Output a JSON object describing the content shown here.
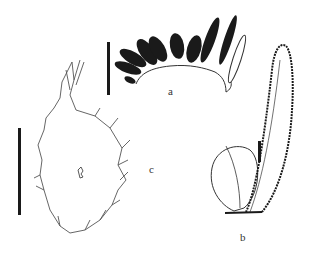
{
  "figure": {
    "panels": [
      {
        "id": "a",
        "label": "a",
        "description": "pinnate frond with dark oblong pinnae along a curved rachis",
        "label_pos": [
          168,
          86
        ]
      },
      {
        "id": "b",
        "label": "b",
        "description": "ovate sterile leaf and narrow elongate fertile leaf with stippled margins",
        "label_pos": [
          240,
          232
        ]
      },
      {
        "id": "c",
        "label": "c",
        "description": "outline of a lobed thallus/rhizome with irregular marginal projections",
        "label_pos": [
          149,
          164
        ]
      }
    ],
    "scale_bars": [
      {
        "panel": "a",
        "x": 108,
        "y1": 42,
        "y2": 95
      },
      {
        "panel": "c",
        "x": 19,
        "y1": 128,
        "y2": 215
      },
      {
        "panel": "b",
        "x": 259,
        "y1": 140,
        "y2": 162
      }
    ],
    "colors": {
      "ink": "#1a1a1a",
      "background": "#ffffff",
      "outline": "#555555"
    }
  }
}
